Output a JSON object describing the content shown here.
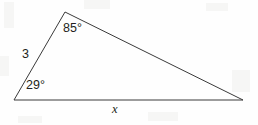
{
  "figure": {
    "type": "triangle-diagram",
    "background_color": "#fefefe",
    "line_color": "#3a3a3a",
    "text_color": "#231f20",
    "vertices": {
      "left": {
        "x": 14,
        "y": 100
      },
      "apex": {
        "x": 65,
        "y": 12
      },
      "right": {
        "x": 243,
        "y": 100
      }
    },
    "labels": {
      "angle_apex": "85°",
      "angle_left": "29°",
      "side_left": "3",
      "side_base": "x"
    }
  },
  "chart_data": {
    "type": "diagram",
    "title": "",
    "shape": "triangle",
    "points": [
      {
        "name": "A",
        "x": 14,
        "y": 100
      },
      {
        "name": "B",
        "x": 65,
        "y": 12
      },
      {
        "name": "C",
        "x": 243,
        "y": 100
      }
    ],
    "edges": [
      {
        "from": "A",
        "to": "B",
        "label": "3"
      },
      {
        "from": "B",
        "to": "C",
        "label": ""
      },
      {
        "from": "A",
        "to": "C",
        "label": "x"
      }
    ],
    "angles": [
      {
        "at": "B",
        "label": "85°",
        "value": 85
      },
      {
        "at": "A",
        "label": "29°",
        "value": 29
      }
    ],
    "annotations": [
      "85°",
      "29°",
      "3",
      "x"
    ]
  }
}
